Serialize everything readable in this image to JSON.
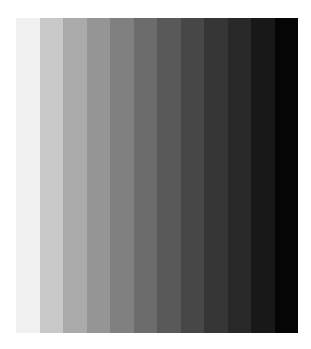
{
  "image": {
    "description": "Grayscale step gradient of vertical stripes, light to dark",
    "background": "#ffffff",
    "panel": {
      "left": 16,
      "top": 18,
      "width": 282,
      "height": 315
    },
    "stripes": [
      {
        "index": 1,
        "color": "#f0f0f0"
      },
      {
        "index": 2,
        "color": "#c8c8c8"
      },
      {
        "index": 3,
        "color": "#aaaaaa"
      },
      {
        "index": 4,
        "color": "#959595"
      },
      {
        "index": 5,
        "color": "#808080"
      },
      {
        "index": 6,
        "color": "#6c6c6c"
      },
      {
        "index": 7,
        "color": "#595959"
      },
      {
        "index": 8,
        "color": "#474747"
      },
      {
        "index": 9,
        "color": "#363636"
      },
      {
        "index": 10,
        "color": "#282828"
      },
      {
        "index": 11,
        "color": "#181818"
      },
      {
        "index": 12,
        "color": "#050505"
      }
    ]
  }
}
